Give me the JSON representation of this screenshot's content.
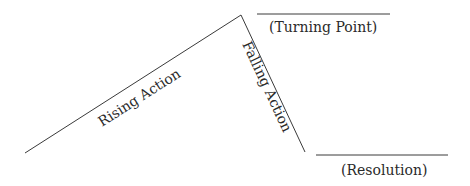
{
  "diagram": {
    "title": "",
    "labels": {
      "rising": "Rising Action",
      "falling": "Falling Action",
      "turning_point": "(Turning Point)",
      "resolution": "(Resolution)"
    },
    "line_color": "#3a3a3a",
    "text_color": "#2a2a2a"
  }
}
